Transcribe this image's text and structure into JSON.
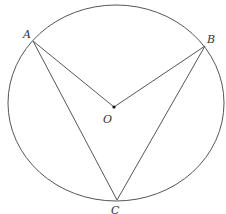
{
  "diagram": {
    "circle": {
      "cx": 116,
      "cy": 103,
      "rx": 108,
      "ry": 98,
      "stroke": "#555555"
    },
    "points": {
      "A": {
        "x": 33,
        "y": 41,
        "label": "A",
        "lx": 23,
        "ly": 37
      },
      "B": {
        "x": 205,
        "y": 46,
        "label": "B",
        "lx": 207,
        "ly": 42
      },
      "O": {
        "x": 114,
        "y": 107,
        "label": "O",
        "lx": 103,
        "ly": 122
      },
      "C": {
        "x": 117,
        "y": 200,
        "label": "C",
        "lx": 111,
        "ly": 213
      }
    },
    "segments": [
      [
        "A",
        "O"
      ],
      [
        "O",
        "B"
      ],
      [
        "A",
        "C"
      ],
      [
        "B",
        "C"
      ]
    ],
    "line_color": "#555555"
  }
}
